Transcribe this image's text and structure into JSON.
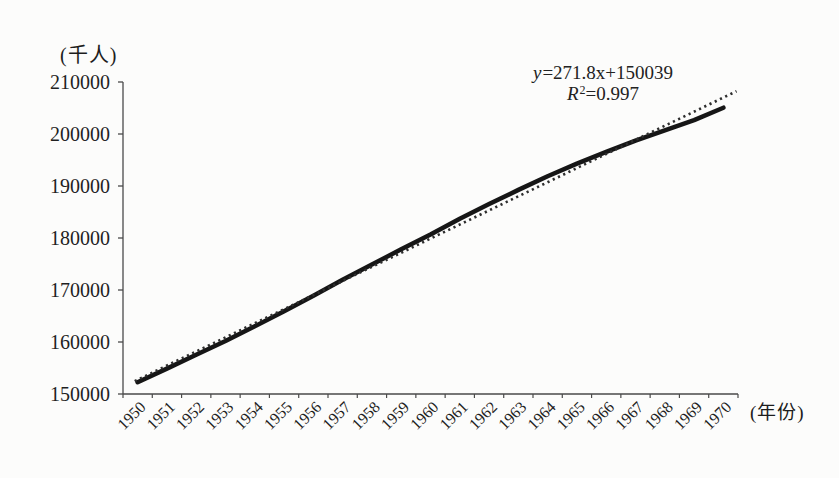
{
  "figure": {
    "y_axis_unit": "(千人)",
    "x_axis_unit": "(年份)",
    "trendline_equation": {
      "var": "y",
      "expression": "=271.8x+150039"
    },
    "r_squared": {
      "var": "R",
      "superscript": "2",
      "value": "=0.997"
    }
  },
  "chart_data": {
    "type": "line",
    "title": "",
    "ylabel": "(千人)",
    "xlabel": "(年份)",
    "x": [
      1950,
      1951,
      1952,
      1953,
      1954,
      1955,
      1956,
      1957,
      1958,
      1959,
      1960,
      1961,
      1962,
      1963,
      1964,
      1965,
      1966,
      1967,
      1968,
      1969,
      1970
    ],
    "series": [
      {
        "name": "population-thousands",
        "line_style": "solid",
        "color": "#161616",
        "values": [
          152271,
          154878,
          157553,
          160184,
          163026,
          165931,
          168903,
          171984,
          174882,
          177830,
          180671,
          183691,
          186538,
          189242,
          191889,
          194303,
          196560,
          198712,
          200706,
          202677,
          205052
        ]
      },
      {
        "name": "linear-trendline",
        "line_style": "dotted",
        "color": "#2e2e2e",
        "fit": "least-squares",
        "label": "y=271.8x+150039",
        "r2": "R²=0.997"
      }
    ],
    "ylim": [
      150000,
      210000
    ],
    "ytick_step": 10000,
    "yticks": [
      150000,
      160000,
      170000,
      180000,
      190000,
      200000,
      210000
    ],
    "grid": false,
    "legend": "none"
  },
  "colors": {
    "background": "#fcfcfb",
    "axis": "#4a4a4a",
    "text": "#1f1f1f"
  }
}
